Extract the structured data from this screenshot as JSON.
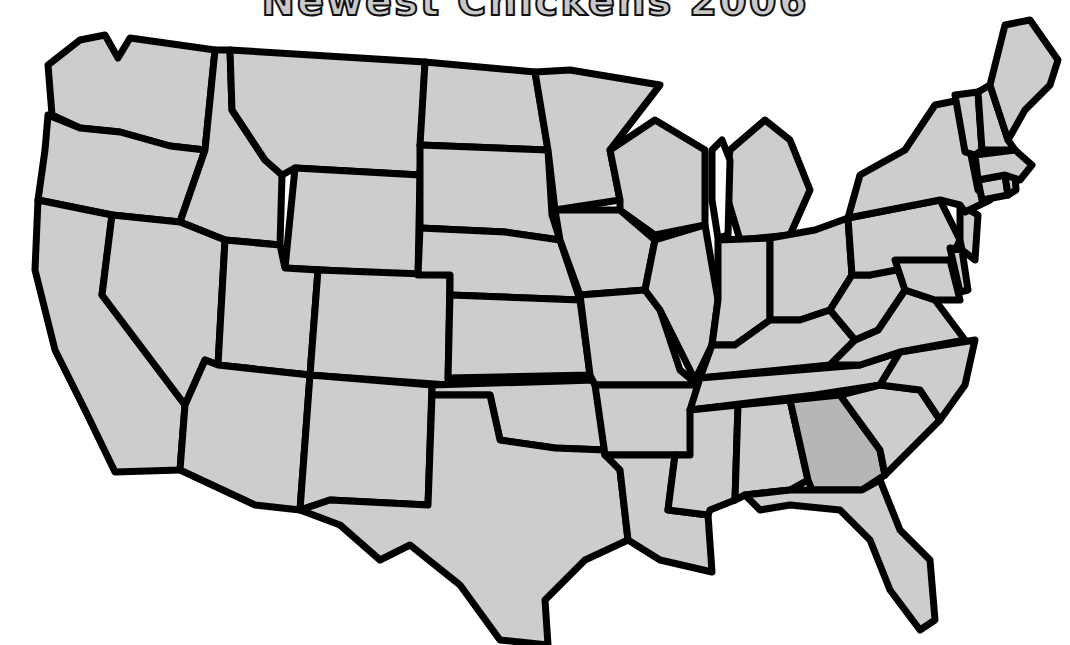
{
  "title": "Newest Chickens 2006",
  "map": {
    "type": "us-states-outline",
    "fill_color": "#cdcdcd",
    "highlight_color": "#b6b6b6",
    "border_color": "#000000",
    "highlighted_states": [
      "Georgia"
    ],
    "states": [
      "Washington",
      "Oregon",
      "California",
      "Idaho",
      "Nevada",
      "Montana",
      "Wyoming",
      "Utah",
      "Arizona",
      "Colorado",
      "New Mexico",
      "North Dakota",
      "South Dakota",
      "Nebraska",
      "Kansas",
      "Oklahoma",
      "Texas",
      "Minnesota",
      "Iowa",
      "Missouri",
      "Arkansas",
      "Louisiana",
      "Wisconsin",
      "Illinois",
      "Michigan",
      "Indiana",
      "Ohio",
      "Kentucky",
      "Tennessee",
      "Mississippi",
      "Alabama",
      "Georgia",
      "Florida",
      "South Carolina",
      "North Carolina",
      "Virginia",
      "West Virginia",
      "Pennsylvania",
      "New York",
      "Maryland",
      "Delaware",
      "New Jersey",
      "Connecticut",
      "Rhode Island",
      "Massachusetts",
      "Vermont",
      "New Hampshire",
      "Maine"
    ]
  }
}
